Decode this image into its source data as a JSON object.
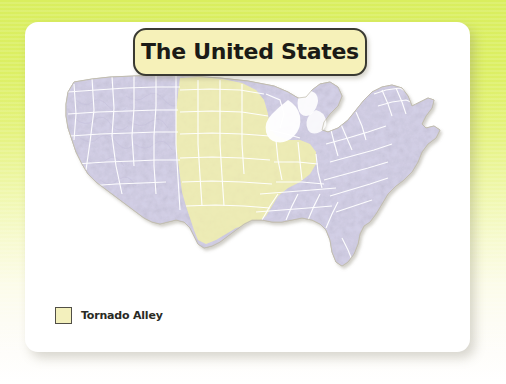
{
  "background": {
    "gradient_top_color": "#d9ee5e",
    "gradient_bottom_color": "#ffffff"
  },
  "card": {
    "background_color": "#ffffff"
  },
  "title": {
    "text": "The United States",
    "box_fill_color": "#f6f1b9",
    "box_border_color": "#3a3a32",
    "text_color": "#1b1b16"
  },
  "map": {
    "region_name": "United States",
    "land_fill_color": "#d5d2e8",
    "land_border_color": "#ffffff",
    "coast_outline_color": "#b9b4a6",
    "highlight_fill_color": "#f0eeb8",
    "highlight_name": "Tornado Alley"
  },
  "legend": {
    "items": [
      {
        "label": "Tornado Alley",
        "swatch_color": "#f3f0bd",
        "swatch_border_color": "#514f46"
      }
    ]
  }
}
